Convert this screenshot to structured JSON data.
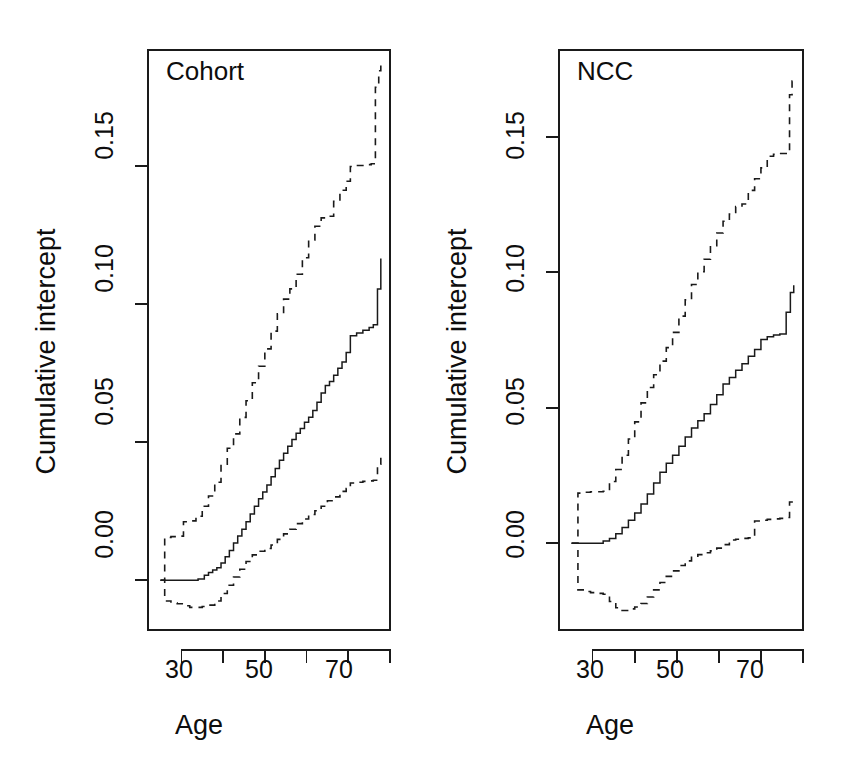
{
  "figure": {
    "width": 844,
    "height": 781,
    "background": "#ffffff",
    "ink_color": "#1a1a1a",
    "panel_count": 2
  },
  "chart_data": [
    {
      "type": "line",
      "title": "Cohort",
      "xlabel": "Age",
      "ylabel": "Cumulative intercept",
      "xlim": [
        22,
        80
      ],
      "ylim": [
        -0.018,
        0.192
      ],
      "xticks": [
        30,
        40,
        50,
        60,
        70,
        80
      ],
      "xticklabels": [
        "30",
        "",
        "50",
        "",
        "70",
        ""
      ],
      "yticks": [
        0.0,
        0.05,
        0.1,
        0.15
      ],
      "yticklabels": [
        "0.00",
        "0.05",
        "0.10",
        "0.15"
      ],
      "grid": false,
      "legend": null,
      "series": [
        {
          "name": "estimate",
          "style": "solid",
          "x": [
            25.0,
            26.0,
            27.0,
            28.0,
            30.0,
            32.0,
            34.0,
            35.5,
            36.5,
            37.5,
            38.5,
            39.5,
            40.5,
            41.5,
            42.5,
            43.5,
            44.5,
            45.5,
            46.5,
            47.5,
            48.5,
            49.5,
            50.5,
            51.5,
            52.5,
            53.5,
            54.5,
            55.5,
            56.5,
            57.5,
            58.5,
            59.5,
            60.5,
            61.5,
            62.5,
            63.5,
            64.5,
            65.5,
            66.5,
            67.5,
            68.5,
            69.5,
            70.5,
            72.0,
            73.5,
            75.0,
            76.0,
            77.0,
            77.8
          ],
          "y": [
            0.0,
            0.0,
            0.0,
            0.0,
            0.0,
            0.0,
            0.0005,
            0.0018,
            0.0028,
            0.0037,
            0.0045,
            0.0063,
            0.0085,
            0.0108,
            0.0135,
            0.016,
            0.0185,
            0.0212,
            0.024,
            0.0268,
            0.0295,
            0.032,
            0.0345,
            0.0375,
            0.0405,
            0.0435,
            0.046,
            0.0485,
            0.051,
            0.0532,
            0.055,
            0.0572,
            0.059,
            0.0615,
            0.0645,
            0.0678,
            0.0705,
            0.072,
            0.0742,
            0.0768,
            0.079,
            0.0825,
            0.0885,
            0.0895,
            0.0905,
            0.0915,
            0.0925,
            0.1055,
            0.1165
          ]
        },
        {
          "name": "upper confidence limit",
          "style": "dashed",
          "x": [
            25.0,
            26.0,
            27.5,
            29.0,
            30.5,
            32.0,
            33.5,
            35.0,
            36.5,
            38.0,
            39.5,
            41.0,
            42.5,
            44.0,
            45.5,
            47.0,
            48.5,
            50.0,
            51.5,
            53.0,
            54.5,
            56.0,
            57.5,
            59.0,
            60.5,
            62.0,
            63.5,
            65.0,
            66.5,
            68.0,
            69.5,
            70.5,
            72.0,
            74.0,
            75.5,
            76.5,
            77.3,
            77.8
          ],
          "y": [
            0.0,
            0.0155,
            0.0158,
            0.016,
            0.0212,
            0.0215,
            0.0232,
            0.0268,
            0.0305,
            0.0355,
            0.042,
            0.0478,
            0.053,
            0.059,
            0.065,
            0.0715,
            0.0775,
            0.0838,
            0.0902,
            0.0965,
            0.1018,
            0.1055,
            0.1108,
            0.1168,
            0.1232,
            0.1282,
            0.1312,
            0.1318,
            0.1372,
            0.1412,
            0.1445,
            0.1498,
            0.1502,
            0.1505,
            0.1508,
            0.1785,
            0.1845,
            0.1885
          ]
        },
        {
          "name": "lower confidence limit",
          "style": "dashed",
          "x": [
            25.0,
            26.0,
            27.5,
            29.0,
            30.5,
            32.0,
            33.5,
            35.0,
            36.5,
            38.0,
            39.5,
            41.0,
            42.5,
            44.0,
            45.5,
            47.0,
            48.5,
            50.0,
            51.5,
            53.0,
            54.5,
            56.0,
            57.5,
            59.0,
            60.5,
            62.0,
            63.5,
            65.0,
            66.5,
            68.0,
            69.5,
            70.5,
            72.0,
            73.5,
            75.0,
            76.0,
            77.0,
            77.8
          ],
          "y": [
            0.0,
            -0.0075,
            -0.0082,
            -0.0085,
            -0.0092,
            -0.0098,
            -0.0098,
            -0.0095,
            -0.009,
            -0.0075,
            -0.0048,
            -0.0018,
            0.0012,
            0.004,
            0.0068,
            0.0092,
            0.0105,
            0.0115,
            0.0128,
            0.0148,
            0.0168,
            0.0185,
            0.0205,
            0.0222,
            0.0238,
            0.0252,
            0.0268,
            0.0288,
            0.0302,
            0.0322,
            0.0332,
            0.0352,
            0.0355,
            0.0358,
            0.036,
            0.0362,
            0.042,
            0.0448
          ]
        }
      ]
    },
    {
      "type": "line",
      "title": "NCC",
      "xlabel": "Age",
      "ylabel": "Cumulative intercept",
      "xlim": [
        22,
        80
      ],
      "ylim": [
        -0.032,
        0.182
      ],
      "xticks": [
        30,
        40,
        50,
        60,
        70,
        80
      ],
      "xticklabels": [
        "30",
        "",
        "50",
        "",
        "70",
        ""
      ],
      "yticks": [
        0.0,
        0.05,
        0.1,
        0.15
      ],
      "yticklabels": [
        "0.00",
        "0.05",
        "0.10",
        "0.15"
      ],
      "grid": false,
      "legend": null,
      "series": [
        {
          "name": "estimate",
          "style": "solid",
          "x": [
            25.0,
            27.0,
            29.0,
            31.0,
            32.5,
            34.0,
            35.5,
            37.0,
            38.5,
            40.0,
            41.5,
            43.0,
            44.5,
            46.0,
            47.5,
            49.0,
            50.5,
            52.0,
            53.5,
            55.0,
            56.5,
            58.0,
            59.5,
            61.0,
            62.5,
            64.0,
            65.5,
            67.0,
            68.5,
            70.0,
            71.5,
            73.0,
            74.5,
            76.0,
            77.0,
            77.8
          ],
          "y": [
            0.0,
            0.0,
            0.0,
            0.0,
            0.0008,
            0.0018,
            0.0035,
            0.0058,
            0.0085,
            0.0112,
            0.0145,
            0.0182,
            0.0222,
            0.0262,
            0.0295,
            0.0325,
            0.0358,
            0.0392,
            0.0425,
            0.0452,
            0.0478,
            0.0512,
            0.0548,
            0.0588,
            0.0612,
            0.0638,
            0.0662,
            0.069,
            0.0715,
            0.0752,
            0.0762,
            0.0768,
            0.0772,
            0.0852,
            0.0925,
            0.0952
          ]
        },
        {
          "name": "upper confidence limit",
          "style": "dashed",
          "x": [
            25.0,
            26.5,
            28.0,
            29.5,
            31.0,
            32.5,
            34.0,
            35.5,
            37.0,
            38.5,
            40.0,
            41.5,
            43.0,
            44.5,
            46.0,
            47.5,
            49.0,
            50.5,
            52.0,
            53.5,
            55.0,
            56.5,
            58.0,
            59.5,
            61.0,
            62.5,
            64.0,
            65.5,
            67.0,
            68.5,
            70.0,
            71.5,
            73.0,
            74.5,
            76.0,
            76.8,
            77.4,
            77.8
          ],
          "y": [
            0.0,
            0.0185,
            0.0188,
            0.019,
            0.019,
            0.0192,
            0.0228,
            0.0272,
            0.0325,
            0.0385,
            0.0448,
            0.0518,
            0.0575,
            0.0622,
            0.0672,
            0.0722,
            0.0778,
            0.0838,
            0.0898,
            0.0955,
            0.1002,
            0.1048,
            0.1098,
            0.1145,
            0.1188,
            0.1215,
            0.1242,
            0.1252,
            0.1302,
            0.1345,
            0.1385,
            0.1428,
            0.1435,
            0.1438,
            0.1442,
            0.1655,
            0.1705,
            0.1722
          ]
        },
        {
          "name": "lower confidence limit",
          "style": "dashed",
          "x": [
            25.0,
            26.5,
            28.0,
            29.5,
            31.0,
            32.5,
            34.0,
            35.5,
            37.0,
            38.5,
            40.0,
            41.5,
            43.0,
            44.5,
            46.0,
            47.5,
            49.0,
            50.5,
            52.0,
            53.5,
            55.0,
            56.5,
            58.0,
            59.5,
            61.0,
            62.5,
            64.0,
            65.5,
            67.0,
            68.5,
            70.0,
            71.5,
            73.0,
            74.5,
            76.0,
            76.8,
            77.4,
            77.8
          ],
          "y": [
            0.0,
            -0.0172,
            -0.0178,
            -0.0182,
            -0.0185,
            -0.0188,
            -0.0215,
            -0.0238,
            -0.0248,
            -0.0242,
            -0.0235,
            -0.0222,
            -0.0198,
            -0.0172,
            -0.0145,
            -0.0122,
            -0.0102,
            -0.0082,
            -0.0065,
            -0.0052,
            -0.0042,
            -0.0035,
            -0.0028,
            -0.0018,
            -0.0005,
            0.0012,
            0.0015,
            0.0018,
            0.002,
            0.0082,
            0.0085,
            0.0088,
            0.009,
            0.0092,
            0.0095,
            0.0152,
            0.0158,
            0.016
          ]
        }
      ]
    }
  ],
  "panels": [
    {
      "id": "cohort",
      "title": "Cohort",
      "xlabel": "Age",
      "ylabel": "Cumulative intercept",
      "xticklabels": [
        "30",
        "50",
        "70"
      ],
      "yticklabels": [
        "0.00",
        "0.05",
        "0.10",
        "0.15"
      ]
    },
    {
      "id": "ncc",
      "title": "NCC",
      "xlabel": "Age",
      "ylabel": "Cumulative intercept",
      "xticklabels": [
        "30",
        "50",
        "70"
      ],
      "yticklabels": [
        "0.00",
        "0.05",
        "0.10",
        "0.15"
      ]
    }
  ]
}
